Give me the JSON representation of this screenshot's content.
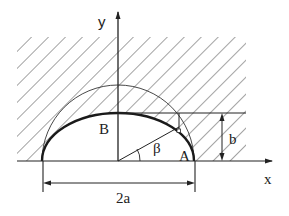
{
  "diagram": {
    "type": "engineering-geometry",
    "labels": {
      "y_axis": "y",
      "x_axis": "x",
      "point_b": "B",
      "point_a": "A",
      "angle": "β",
      "height_dim": "b",
      "width_dim": "2a"
    },
    "colors": {
      "line": "#222222",
      "hatch": "#555555",
      "background": "#ffffff"
    },
    "geometry": {
      "origin": [
        118,
        161
      ],
      "semi_axis_a_px": 76,
      "semi_axis_b_px": 48,
      "hatch_region": {
        "x0": 17,
        "y0": 37,
        "x1": 246,
        "y1": 161
      }
    }
  }
}
